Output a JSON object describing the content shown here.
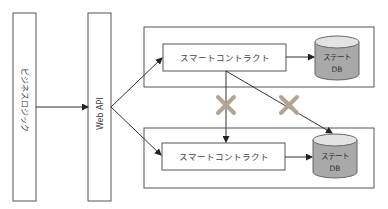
{
  "diagram": {
    "business_logic": {
      "label": "ビジネスロジック"
    },
    "web_api": {
      "label": "Web API"
    },
    "nodes": [
      {
        "contract_label": "スマートコントラクト",
        "db_label_line1": "ステート",
        "db_label_line2": "DB"
      },
      {
        "contract_label": "スマートコントラクト",
        "db_label_line1": "ステート",
        "db_label_line2": "DB"
      }
    ],
    "colors": {
      "cross_mark": "#b3a593",
      "db_fill": "#a9a9a9",
      "db_top": "#e3e3e3",
      "stroke": "#555555"
    },
    "blocked_connections": [
      {
        "from": "contract-1",
        "to": "contract-2",
        "mark": "cross"
      },
      {
        "from": "contract-1",
        "to": "state-db-2",
        "mark": "cross"
      }
    ]
  }
}
